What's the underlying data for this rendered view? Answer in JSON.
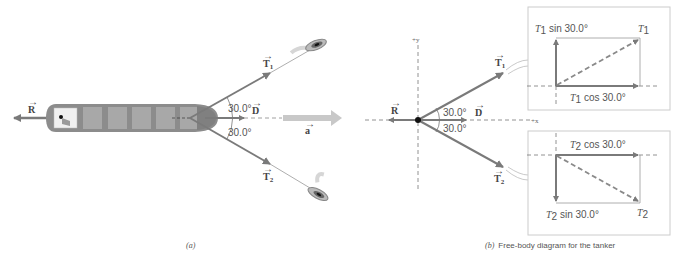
{
  "panel_a": {
    "caption": "(a)",
    "vectors": {
      "R": "R",
      "D": "D",
      "a": "a",
      "T1": "T",
      "T1_sub": "1",
      "T2": "T",
      "T2_sub": "2"
    },
    "angle_upper": "30.0°",
    "angle_lower": "30.0°"
  },
  "panel_b": {
    "caption_label": "(b)",
    "caption_text": "Free-body diagram for the tanker",
    "axes": {
      "x": "+x",
      "y": "+y"
    },
    "vectors": {
      "R": "R",
      "D": "D",
      "T1": "T",
      "T1_sub": "1",
      "T2": "T",
      "T2_sub": "2"
    },
    "angle_upper": "30.0°",
    "angle_lower": "30.0°",
    "inset_T1": {
      "vertical_label_T": "T",
      "vertical_label_sub": "1",
      "vertical_label_rest": " sin 30.0°",
      "horizontal_label_T": "T",
      "horizontal_label_sub": "1",
      "horizontal_label_rest": " cos 30.0°",
      "resultant_T": "T",
      "resultant_sub": "1"
    },
    "inset_T2": {
      "horizontal_label_T": "T",
      "horizontal_label_sub": "2",
      "horizontal_label_rest": " cos 30.0°",
      "vertical_label_T": "T",
      "vertical_label_sub": "2",
      "vertical_label_rest": " sin 30.0°",
      "resultant_T": "T",
      "resultant_sub": "2"
    }
  },
  "colors": {
    "vector": "#7a7a7a",
    "hull": "#8c8c8c",
    "cargo": "#a8a8a8",
    "accel": "#c8c8c8",
    "dash": "#777777",
    "inset_border": "#cccccc"
  }
}
